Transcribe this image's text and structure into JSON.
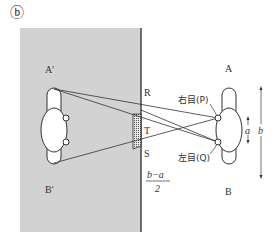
{
  "figure": {
    "panel_label": "ⓑ",
    "mirror_image_top": "A'",
    "mirror_image_bottom": "B'",
    "point_R": "R",
    "point_T": "T",
    "point_S": "S",
    "person_top": "A",
    "person_bottom": "B",
    "right_eye": "右目(P)",
    "left_eye": "左目(Q)",
    "dim_a": "a",
    "dim_b": "b",
    "fraction_numerator": "b−a",
    "fraction_denominator": "2"
  },
  "colors": {
    "mirror_fill": "#d2d2d2",
    "mirror_edge": "#444444",
    "line": "#333333",
    "background": "#ffffff"
  }
}
